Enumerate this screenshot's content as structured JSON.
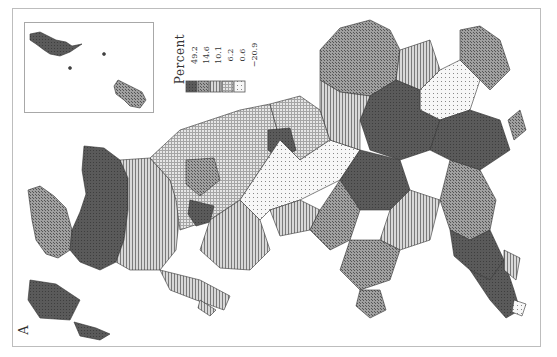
{
  "figure": {
    "panel_label": "A",
    "orientation": "rotated 90 degrees counter-clockwise"
  },
  "legend": {
    "title": "Percent",
    "breaks": [
      "49.2",
      "14.6",
      "10.1",
      "6.2",
      "0.6",
      "−20.9"
    ],
    "classes": [
      {
        "range": "14.6 to 49.2",
        "pattern": "dark-solid",
        "color": "#555555"
      },
      {
        "range": "10.1 to 14.6",
        "pattern": "crosshatch",
        "color": "#8a8a8a"
      },
      {
        "range": "6.2 to 10.1",
        "pattern": "vertical-lines",
        "color": "#a8a8a8"
      },
      {
        "range": "0.6 to 6.2",
        "pattern": "grid",
        "color": "#c4c4c4"
      },
      {
        "range": "-20.9 to 0.6",
        "pattern": "dots",
        "color": "#e2e2e2"
      }
    ]
  },
  "colors": {
    "frame": "#bdbdbd",
    "boundary": "#333333",
    "background": "#ffffff"
  }
}
